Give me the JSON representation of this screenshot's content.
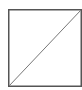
{
  "icon": {
    "name": "diagonal-square-icon",
    "border_color": "#555555",
    "line_color": "#777777",
    "background": "#ffffff"
  }
}
